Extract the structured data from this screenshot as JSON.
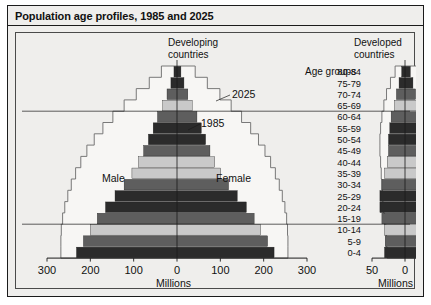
{
  "figure": {
    "title": "Population age profiles, 1985 and 2025",
    "panel_left_heading": "Developing\ncountries",
    "panel_right_heading": "Developed\ncountries",
    "age_groups_header": "Age groups",
    "male_label": "Male",
    "female_label": "Female",
    "annotation_2025": "2025",
    "annotation_1985": "1985",
    "axis_label_left": "Millions",
    "axis_label_right": "Millions"
  },
  "colors": {
    "background": "#efeeec",
    "frame": "#1b1b1b",
    "plot_border": "#4a4a4a",
    "band_dark": "#2b2b2b",
    "band_mid": "#5e5e5e",
    "band_light": "#c9c9c9",
    "band_pale": "#9a9a9a",
    "outline_2025": "#6b6b6b",
    "outline_fill": "#f7f6f4"
  },
  "chart_data": {
    "type": "bar",
    "title": "Population age profiles, 1985 and 2025",
    "subtype": "population-pyramid",
    "panels": [
      {
        "name": "Developing countries",
        "xlabel": "Millions",
        "xlim": [
          -300,
          300
        ],
        "xticks": [
          -300,
          -200,
          -100,
          0,
          100,
          200,
          300
        ],
        "xticklabels": [
          "300",
          "200",
          "100",
          "0",
          "100",
          "200",
          "300"
        ],
        "categories": [
          "0-4",
          "5-9",
          "10-14",
          "15-19",
          "20-24",
          "25-29",
          "30-34",
          "35-39",
          "40-44",
          "45-49",
          "50-54",
          "55-59",
          "60-64",
          "65-69",
          "70-74",
          "75-79",
          "80-84"
        ],
        "series": [
          {
            "name": "1985",
            "style": "filled-bars",
            "male": [
              232,
              216,
              200,
              184,
              165,
              143,
              122,
              104,
              89,
              77,
              66,
              55,
              45,
              33,
              23,
              14,
              7
            ],
            "female": [
              224,
              209,
              193,
              178,
              160,
              139,
              119,
              101,
              87,
              76,
              66,
              56,
              46,
              35,
              25,
              16,
              9
            ]
          },
          {
            "name": "2025",
            "style": "step-outline",
            "male": [
              268,
              268,
              267,
              264,
              259,
              252,
              244,
              234,
              222,
              208,
              191,
              171,
              148,
              122,
              94,
              64,
              36
            ],
            "female": [
              256,
              256,
              255,
              253,
              249,
              243,
              236,
              227,
              216,
              203,
              188,
              170,
              149,
              125,
              99,
              70,
              42
            ]
          }
        ]
      },
      {
        "name": "Developed countries",
        "xlabel": "Millions",
        "xlim": [
          -50,
          50
        ],
        "xticks": [
          -50,
          0,
          50
        ],
        "xticklabels": [
          "50",
          "0",
          "50"
        ],
        "categories": [
          "0-4",
          "5-9",
          "10-14",
          "15-19",
          "20-24",
          "25-29",
          "30-34",
          "35-39",
          "40-44",
          "45-49",
          "50-54",
          "55-59",
          "60-64",
          "65-69",
          "70-74",
          "75-79",
          "80-84"
        ],
        "series": [
          {
            "name": "1985",
            "style": "filled-bars",
            "male": [
              31,
              30,
              31,
              35,
              38,
              38,
              35,
              31,
              27,
              25,
              25,
              23,
              21,
              16,
              13,
              9,
              5
            ],
            "female": [
              30,
              29,
              30,
              33,
              36,
              37,
              34,
              30,
              27,
              25,
              25,
              24,
              23,
              19,
              16,
              12,
              8
            ]
          },
          {
            "name": "2025",
            "style": "step-outline",
            "male": [
              27,
              28,
              29,
              31,
              33,
              34,
              35,
              36,
              37,
              38,
              38,
              37,
              35,
              32,
              28,
              22,
              15
            ],
            "female": [
              26,
              27,
              28,
              30,
              32,
              33,
              34,
              35,
              36,
              37,
              38,
              37,
              36,
              34,
              31,
              26,
              19
            ]
          }
        ]
      }
    ],
    "reference_lines": [
      {
        "between": [
          "65-69",
          "60-64"
        ],
        "note": "horizontal rule"
      },
      {
        "between": [
          "15-19",
          "10-14"
        ],
        "note": "horizontal rule"
      }
    ],
    "annotations": [
      {
        "text": "2025",
        "points_to": "2025 outline"
      },
      {
        "text": "1985",
        "points_to": "1985 bar edge"
      },
      {
        "text": "Male",
        "side": "left"
      },
      {
        "text": "Female",
        "side": "right"
      }
    ],
    "grid": false,
    "legend": "inline annotations"
  }
}
